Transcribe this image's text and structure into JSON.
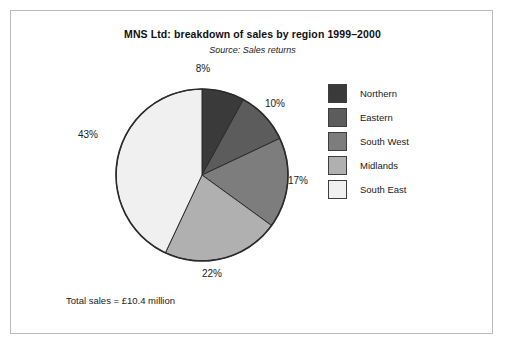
{
  "chart_data": {
    "type": "pie",
    "title": "MNS Ltd: breakdown of sales by region 1999–2000",
    "subtitle": "Source: Sales returns",
    "caption": "Total sales = £10.4 million",
    "categories": [
      "Northern",
      "Eastern",
      "South West",
      "Midlands",
      "South East"
    ],
    "values": [
      8,
      10,
      17,
      22,
      43
    ],
    "value_labels": [
      "8%",
      "10%",
      "17%",
      "22%",
      "43%"
    ],
    "unit": "%",
    "colors": [
      "#3a3a3a",
      "#5c5c5c",
      "#7d7d7d",
      "#b0b0b0",
      "#f0f0f0"
    ],
    "start_angle_deg": 0,
    "direction": "clockwise",
    "legend_position": "right",
    "grid": false,
    "xlabel": "",
    "ylabel": ""
  },
  "legend": {
    "items": [
      {
        "label": "Northern",
        "color": "#3a3a3a"
      },
      {
        "label": "Eastern",
        "color": "#5c5c5c"
      },
      {
        "label": "South West",
        "color": "#7d7d7d"
      },
      {
        "label": "Midlands",
        "color": "#b0b0b0"
      },
      {
        "label": "South East",
        "color": "#f0f0f0"
      }
    ]
  },
  "slice_labels": {
    "northern": "8%",
    "eastern": "10%",
    "south_west": "17%",
    "midlands": "22%",
    "south_east": "43%"
  }
}
